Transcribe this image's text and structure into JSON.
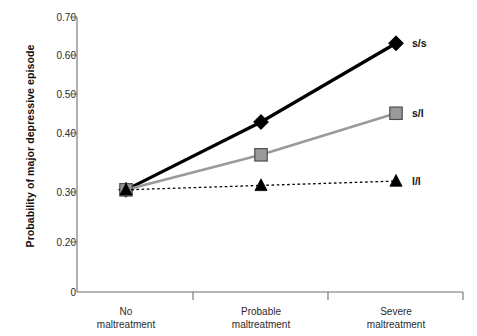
{
  "chart_data": {
    "type": "line",
    "title": "",
    "xlabel": "",
    "ylabel": "Probability of major depressive episode",
    "categories": [
      "No maltreatment",
      "Probable maltreatment",
      "Severe maltreatment"
    ],
    "category_lines": [
      [
        "No",
        "maltreatment"
      ],
      [
        "Probable",
        "maltreatment"
      ],
      [
        "Severe",
        "maltreatment"
      ]
    ],
    "ylim": [
      0.2,
      0.7
    ],
    "y_axis_break": true,
    "y_zero_label": "0",
    "yticks": [
      0.2,
      0.3,
      0.4,
      0.5,
      0.6,
      0.7
    ],
    "ytick_labels": [
      "0.20",
      "0.30",
      "0.40",
      "0.50",
      "0.60",
      "0.70"
    ],
    "grid": false,
    "legend_position": "right-inline",
    "series": [
      {
        "name": "s/s",
        "label": "s/s",
        "values": [
          0.305,
          0.46,
          0.64
        ],
        "color": "#000000",
        "marker": "diamond",
        "line_style": "solid",
        "line_width": 3.2
      },
      {
        "name": "s/l",
        "label": "s/l",
        "values": [
          0.305,
          0.385,
          0.48
        ],
        "color": "#9a9a9a",
        "marker": "square",
        "line_style": "solid",
        "line_width": 2.6
      },
      {
        "name": "l/l",
        "label": "l/l",
        "values": [
          0.305,
          0.315,
          0.325
        ],
        "color": "#000000",
        "marker": "triangle",
        "line_style": "dotted",
        "line_width": 1.3
      }
    ]
  },
  "axis": {
    "line_color": "#6e6e6e",
    "tick_color": "#6e6e6e"
  }
}
